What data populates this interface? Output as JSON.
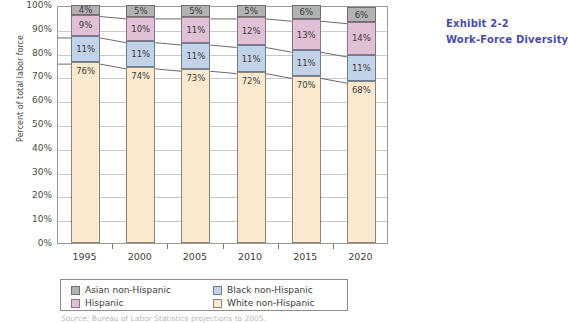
{
  "exhibit": {
    "number": "Exhibit 2-2",
    "title": "Work-Force Diversity",
    "color": "#4a4aa8"
  },
  "source_note": {
    "label": "Source:",
    "text": "Bureau of Labor Statistics projections to 2005."
  },
  "legend": {
    "items": [
      {
        "label": "Asian non-Hispanic",
        "color": "#b2b2b2",
        "key": "asian"
      },
      {
        "label": "Black non-Hispanic",
        "color": "#c2d2e8",
        "key": "black"
      },
      {
        "label": "Hispanic",
        "color": "#dfc0d5",
        "key": "hispanic"
      },
      {
        "label": "White non-Hispanic",
        "color": "#fbe9cf",
        "key": "white"
      }
    ]
  },
  "chart_data": {
    "type": "bar",
    "stacked": true,
    "title": "Work-Force Diversity",
    "xlabel": "",
    "ylabel": "Percent of total labor force",
    "ylim": [
      0,
      100
    ],
    "ytick_labels": [
      "0%",
      "10%",
      "20%",
      "30%",
      "40%",
      "50%",
      "60%",
      "70%",
      "80%",
      "90%",
      "100%"
    ],
    "yticks": [
      0,
      10,
      20,
      30,
      40,
      50,
      60,
      70,
      80,
      90,
      100
    ],
    "grid": true,
    "legend_position": "bottom",
    "categories": [
      "1995",
      "2000",
      "2005",
      "2010",
      "2015",
      "2020"
    ],
    "series": [
      {
        "name": "White non-Hispanic",
        "color": "#fbe9cf",
        "values": [
          76,
          74,
          73,
          72,
          70,
          68
        ],
        "labels": [
          "76%",
          "74%",
          "73%",
          "72%",
          "70%",
          "68%"
        ]
      },
      {
        "name": "Black non-Hispanic",
        "color": "#c2d2e8",
        "values": [
          11,
          11,
          11,
          11,
          11,
          11
        ],
        "labels": [
          "11%",
          "11%",
          "11%",
          "11%",
          "11%",
          "11%"
        ]
      },
      {
        "name": "Hispanic",
        "color": "#dfc0d5",
        "values": [
          9,
          10,
          11,
          12,
          13,
          14
        ],
        "labels": [
          "9%",
          "10%",
          "11%",
          "12%",
          "13%",
          "14%"
        ]
      },
      {
        "name": "Asian non-Hispanic",
        "color": "#b2b2b2",
        "values": [
          4,
          5,
          5,
          5,
          6,
          6
        ],
        "labels": [
          "4%",
          "5%",
          "5%",
          "5%",
          "6%",
          "6%"
        ]
      }
    ]
  }
}
